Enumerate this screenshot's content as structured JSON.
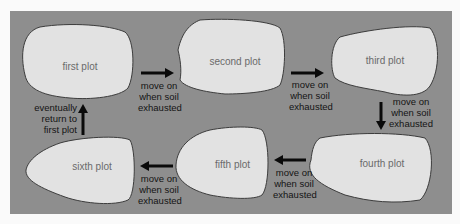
{
  "diagram": {
    "colors": {
      "panel": "#8e8e8e",
      "plot_fill": "#e2e2e2",
      "plot_stroke": "#3c3c3c",
      "arrow": "#0a0a0a",
      "plot_text": "#6a6a6a",
      "caption_text": "#141414"
    },
    "plots": [
      {
        "id": "first",
        "label": "first plot"
      },
      {
        "id": "second",
        "label": "second plot"
      },
      {
        "id": "third",
        "label": "third plot"
      },
      {
        "id": "fourth",
        "label": "fourth plot"
      },
      {
        "id": "fifth",
        "label": "fifth plot"
      },
      {
        "id": "sixth",
        "label": "sixth plot"
      }
    ],
    "arrows": [
      {
        "from": "first",
        "to": "second",
        "caption": [
          "move on",
          "when soil",
          "exhausted"
        ]
      },
      {
        "from": "second",
        "to": "third",
        "caption": [
          "move on",
          "when soil",
          "exhausted"
        ]
      },
      {
        "from": "third",
        "to": "fourth",
        "caption": [
          "move on",
          "when soil",
          "exhausted"
        ]
      },
      {
        "from": "fourth",
        "to": "fifth",
        "caption": [
          "move on",
          "when soil",
          "exhausted"
        ]
      },
      {
        "from": "fifth",
        "to": "sixth",
        "caption": [
          "move on",
          "when soil",
          "exhausted"
        ]
      },
      {
        "from": "sixth",
        "to": "first",
        "caption": [
          "eventually",
          "return to",
          "first plot"
        ]
      }
    ]
  }
}
